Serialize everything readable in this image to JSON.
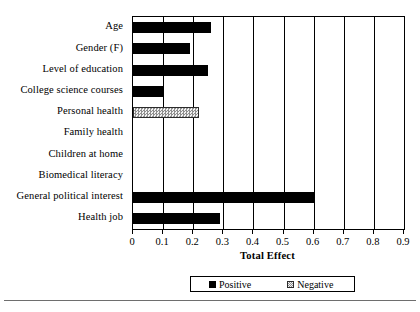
{
  "chart_data": {
    "type": "bar",
    "orientation": "horizontal",
    "title": "",
    "xlabel": "Total Effect",
    "ylabel": "",
    "xlim": [
      0,
      0.9
    ],
    "grid": true,
    "legend_position": "bottom",
    "categories": [
      "Age",
      "Gender (F)",
      "Level of education",
      "College science courses",
      "Personal health",
      "Family health",
      "Children at home",
      "Biomedical literacy",
      "General political interest",
      "Health job"
    ],
    "values": [
      0.26,
      0.19,
      0.25,
      0.1,
      0.22,
      0,
      0,
      0,
      0.6,
      0.29
    ],
    "effect_signs": [
      "positive",
      "positive",
      "positive",
      "positive",
      "negative",
      "none",
      "none",
      "none",
      "positive",
      "positive"
    ],
    "tick_labels": [
      "0",
      "0.1",
      "0.2",
      "0.3",
      "0.4",
      "0.5",
      "0.6",
      "0.7",
      "0.8",
      "0.9"
    ],
    "tick_values": [
      0,
      0.1,
      0.2,
      0.3,
      0.4,
      0.5,
      0.6,
      0.7,
      0.8,
      0.9
    ],
    "legend": [
      {
        "label": "Positive",
        "pattern": "solid",
        "color": "#000000"
      },
      {
        "label": "Negative",
        "pattern": "hatched",
        "color": "#8f8f8f"
      }
    ]
  }
}
